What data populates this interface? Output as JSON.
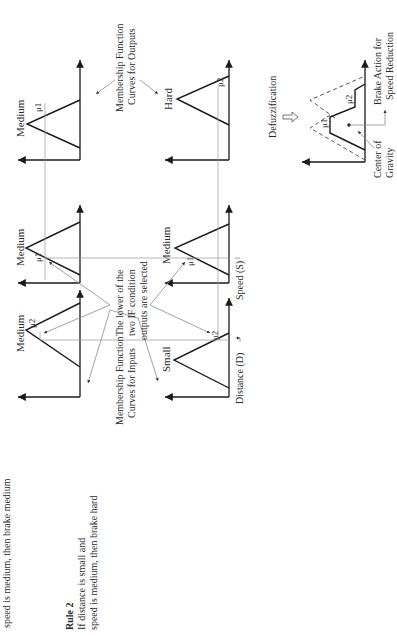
{
  "rule1_tail": "speed is medium, then brake medium",
  "rule2": {
    "title": "Rule 2",
    "line1": "If distance is small and",
    "line2": "speed is medium, then brake hard"
  },
  "rule1_panels": {
    "distance_label": "Medium",
    "speed_label": "Medium",
    "output_label": "Medium",
    "mu_distance": "μ2",
    "mu_speed": "μ1",
    "mu_output": "μ1"
  },
  "rule2_panels": {
    "distance_label": "Small",
    "speed_label": "Medium",
    "output_label": "Hard",
    "mu_distance": "μ2",
    "mu_speed": "μ1",
    "mu_output": "μ2"
  },
  "annotations": {
    "inputs_curves_line1": "Membership Function",
    "inputs_curves_line2": "Curves for Inputs",
    "outputs_curves_line1": "Membership Function",
    "outputs_curves_line2": "Curves for Outputs",
    "lower_line1": "The lower of the",
    "lower_line2": "two IF condition",
    "lower_line3": "outputs are selected",
    "distance_axis": "Distance (D)",
    "speed_axis": "Speed (S)",
    "defuzz": "Defuzzification",
    "cog_line1": "Center of",
    "cog_line2": "Gravity",
    "brake_line1": "Brake Action for",
    "brake_line2": "Speed Reduction",
    "mu1_result": "μ1",
    "mu2_result": "μ2"
  }
}
